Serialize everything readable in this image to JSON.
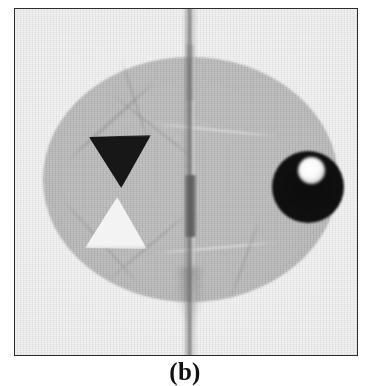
{
  "figure": {
    "caption": "(b)",
    "panel_label": "b",
    "modality": "grayscale tomographic reconstruction",
    "frame": {
      "border_color": "#2b2b2b",
      "background_color": "#f2f2f2",
      "x": 14,
      "y": 8,
      "width": 344,
      "height": 348
    },
    "page_background": "#ffffff"
  },
  "scan": {
    "background_label": "air-background",
    "background_color": "#efefef",
    "phantom": {
      "name": "elliptical-phantom",
      "shape": "ellipse",
      "fill_color": "#c0c0c0",
      "center_x": 175,
      "center_y": 170,
      "radius_x": 147,
      "radius_y": 122
    },
    "features": [
      {
        "name": "dark-triangle",
        "shape": "triangle-down",
        "fill_color": "#171717",
        "description": "high-density triangular insert pointing downward",
        "center_x": 105,
        "center_y": 152,
        "width": 62,
        "height": 53
      },
      {
        "name": "light-triangle",
        "shape": "triangle-up",
        "fill_color": "#f3f3f3",
        "description": "low-density triangular insert pointing upward",
        "center_x": 101,
        "center_y": 214,
        "width": 62,
        "height": 52
      },
      {
        "name": "dark-circle",
        "shape": "circle",
        "fill_color": "#101010",
        "description": "high-density circular insert",
        "center_x": 293,
        "center_y": 178,
        "radius": 36
      },
      {
        "name": "bright-inclusion",
        "shape": "circle",
        "fill_color": "#ffffff",
        "description": "bright low-density inclusion inside the dark circle",
        "center_x": 296,
        "center_y": 161,
        "radius": 13
      },
      {
        "name": "metal-rod",
        "shape": "vertical-bar",
        "fill_color": "#5c5c5c",
        "description": "metallic rod at the phantom centre",
        "center_x": 175,
        "center_y": 197,
        "width": 11,
        "height": 62
      },
      {
        "name": "metal-streak-artifact",
        "shape": "vertical-streak",
        "fill_color": "#6e6e6e",
        "description": "full-height vertical streak artifact caused by the metal rod",
        "center_x": 175,
        "width": 14,
        "height": 356
      }
    ],
    "streaks": [
      {
        "name": "streak-upper-left",
        "angle_deg": -42,
        "x": 96,
        "y": 112,
        "length": 120,
        "thickness": 3,
        "tone": "dark"
      },
      {
        "name": "streak-upper-right",
        "angle_deg": 38,
        "x": 140,
        "y": 118,
        "length": 110,
        "thickness": 2,
        "tone": "dark"
      },
      {
        "name": "streak-lower-left",
        "angle_deg": 48,
        "x": 86,
        "y": 232,
        "length": 120,
        "thickness": 2,
        "tone": "dark"
      },
      {
        "name": "streak-lower-right",
        "angle_deg": -40,
        "x": 134,
        "y": 236,
        "length": 110,
        "thickness": 2,
        "tone": "dark"
      },
      {
        "name": "streak-horizontal-upper",
        "angle_deg": 6,
        "x": 200,
        "y": 120,
        "length": 130,
        "thickness": 2,
        "tone": "light"
      },
      {
        "name": "streak-horizontal-lower",
        "angle_deg": -5,
        "x": 200,
        "y": 238,
        "length": 130,
        "thickness": 2,
        "tone": "light"
      },
      {
        "name": "streak-fan-left",
        "angle_deg": 72,
        "x": 120,
        "y": 92,
        "length": 90,
        "thickness": 2,
        "tone": "dark"
      },
      {
        "name": "streak-fan-right",
        "angle_deg": -70,
        "x": 230,
        "y": 250,
        "length": 90,
        "thickness": 2,
        "tone": "dark"
      }
    ]
  }
}
